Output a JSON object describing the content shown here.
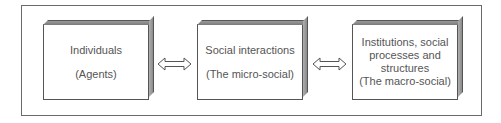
{
  "diagram": {
    "boxes": [
      {
        "lines": [
          "Individuals",
          "",
          "(Agents)"
        ]
      },
      {
        "lines": [
          "Social interactions",
          "",
          "(The micro-social)"
        ]
      },
      {
        "lines": [
          "Institutions, social",
          "processes and",
          "structures",
          "(The macro-social)"
        ]
      }
    ],
    "arrows": [
      {
        "from": 0,
        "to": 1,
        "type": "double-headed-hollow"
      },
      {
        "from": 1,
        "to": 2,
        "type": "double-headed-hollow"
      }
    ],
    "colors": {
      "border": "#555555",
      "text": "#555555",
      "shade": "#8a8a8a"
    }
  }
}
